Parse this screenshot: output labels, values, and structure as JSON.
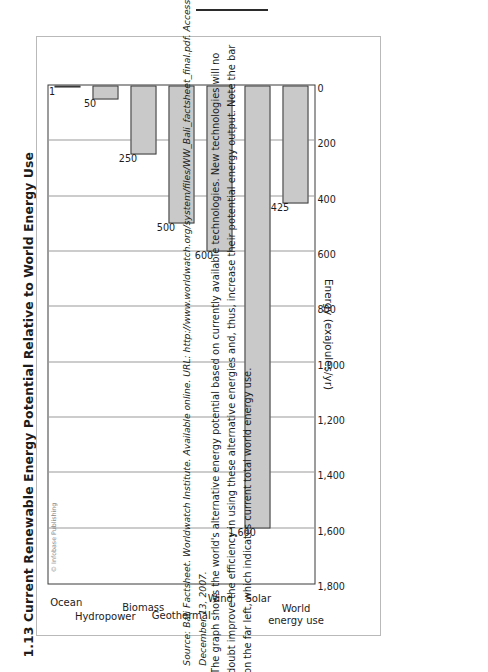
{
  "page": {
    "top_rule": "horizontal-rule"
  },
  "figure": {
    "number_and_title": "1.13  Current Renewable Energy Potential Relative to World Energy Use",
    "copyright": "© Infobase Publishing"
  },
  "chart_data": {
    "type": "bar",
    "orientation": "horizontal",
    "title": "1.13  Current Renewable Energy Potential Relative to World Energy Use",
    "xlabel": "Energy (exajoules/yr)",
    "ylabel": "",
    "xlim": [
      0,
      1800
    ],
    "xticks": [
      "0",
      "200",
      "400",
      "600",
      "800",
      "1,000",
      "1,200",
      "1,400",
      "1,600",
      "1,800"
    ],
    "grid": true,
    "legend": "none",
    "categories": [
      "World energy use",
      "Solar",
      "Wind",
      "Geothermal",
      "Biomass",
      "Hydropower",
      "Ocean"
    ],
    "values": [
      425,
      1600,
      600,
      500,
      250,
      50,
      1
    ],
    "data_labels": [
      "425",
      "1,600",
      "600",
      "500",
      "250",
      "50",
      "1"
    ],
    "bar_fill": "#c9c9c9",
    "bar_stroke": "#3a3a3a"
  },
  "caption": {
    "line1": "The graph shows the world's alternative energy potential based on currently available technologies. New technologies will no",
    "line2": "doubt improve the efficiency in using these alternative energies and, thus, increase their potential energy output. Note the bar",
    "line3": "on the far left, which indicates current total world energy use."
  },
  "source": {
    "line1": "Source: Bali Factsheet. Worldwatch Institute. Available online. URL: http://www.worldwatch.org/system/files/WW_Bali_factsheet_final.pdf.  Accessed",
    "line2": "December 13, 2007."
  }
}
